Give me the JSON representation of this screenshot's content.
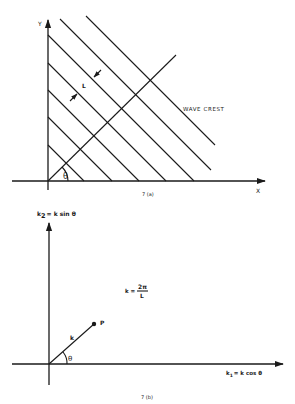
{
  "figure_a": {
    "caption": "7 (a)",
    "x_axis_label": "X",
    "y_axis_label": "Y",
    "angle_label": "θ",
    "spacing_label": "L",
    "wave_crest_label": "WAVE CREST",
    "crest_lines": [
      {
        "x1": 48,
        "y1": 145,
        "x2": 84,
        "y2": 181
      },
      {
        "x1": 48,
        "y1": 117,
        "x2": 112,
        "y2": 181
      },
      {
        "x1": 48,
        "y1": 90,
        "x2": 139,
        "y2": 181
      },
      {
        "x1": 48,
        "y1": 63,
        "x2": 166,
        "y2": 181
      },
      {
        "x1": 48,
        "y1": 35,
        "x2": 194,
        "y2": 181
      },
      {
        "x1": 60,
        "y1": 19,
        "x2": 211,
        "y2": 170
      },
      {
        "x1": 86,
        "y1": 16,
        "x2": 215,
        "y2": 145
      }
    ],
    "direction_line": {
      "x1": 48,
      "y1": 181,
      "x2": 176,
      "y2": 55
    }
  },
  "figure_b": {
    "caption": "7 (b)",
    "x_axis_label_main": "k",
    "x_axis_label_sub": "1",
    "x_axis_label_rest": "= k cos θ",
    "y_axis_label_main": "k",
    "y_axis_label_sub": "2",
    "y_axis_label_rest": "= k sin θ",
    "angle_label": "θ",
    "vector_label": "k",
    "point_label": "P",
    "formula_lhs": "k =",
    "formula_num": "2π",
    "formula_den": "L",
    "vector": {
      "x1": 49,
      "y1": 364,
      "x2": 94,
      "y2": 324
    }
  }
}
